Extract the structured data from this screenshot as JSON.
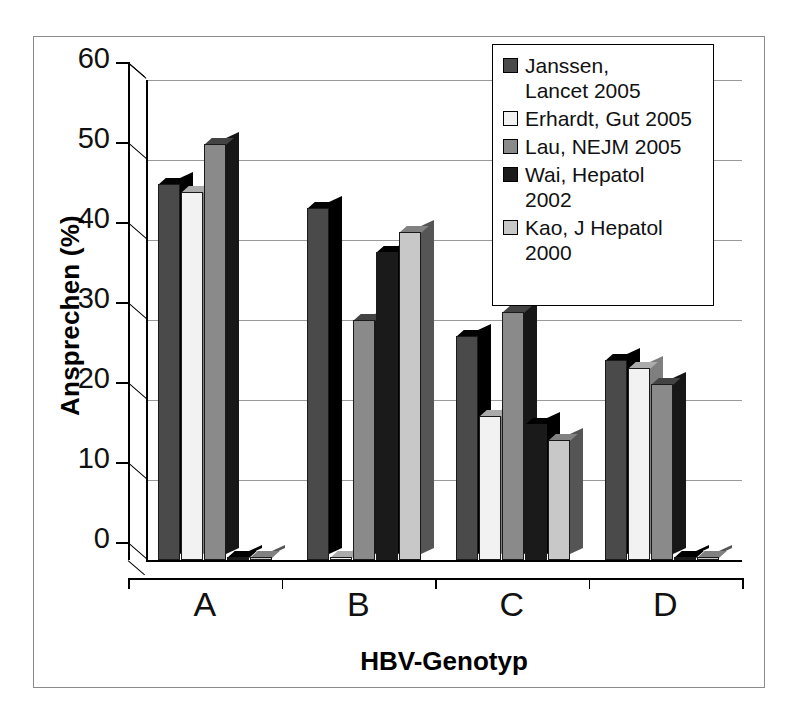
{
  "chart_data": {
    "type": "bar",
    "title": "",
    "xlabel": "HBV-Genotyp",
    "ylabel": "Ansprechen (%)",
    "categories": [
      "A",
      "B",
      "C",
      "D"
    ],
    "ylim": [
      0,
      60
    ],
    "yticks": [
      0,
      10,
      20,
      30,
      40,
      50,
      60
    ],
    "grid": true,
    "legend_position": "top-right",
    "style": "3d-clustered-column",
    "series": [
      {
        "name": "Janssen, Lancet 2005",
        "color": "#4a4a4a",
        "values": [
          47,
          44,
          28,
          25
        ]
      },
      {
        "name": "Erhardt, Gut 2005",
        "color": "#f2f2f2",
        "values": [
          46,
          0,
          18,
          24
        ]
      },
      {
        "name": "Lau, NEJM 2005",
        "color": "#8a8a8a",
        "values": [
          52,
          30,
          31,
          22
        ]
      },
      {
        "name": "Wai, Hepatol 2002",
        "color": "#1a1a1a",
        "values": [
          0,
          38.5,
          17,
          0
        ]
      },
      {
        "name": "Kao, J Hepatol 2000",
        "color": "#c8c8c8",
        "values": [
          0,
          41,
          15,
          0
        ]
      }
    ]
  },
  "axis": {
    "ytick_labels": [
      "60",
      "50",
      "40",
      "30",
      "20",
      "10",
      "0"
    ],
    "xtick_labels": [
      "A",
      "B",
      "C",
      "D"
    ],
    "y_title": "Ansprechen (%)",
    "x_title": "HBV-Genotyp"
  },
  "legend": {
    "items": [
      {
        "label": "Janssen,\nLancet 2005",
        "line1": "Janssen,",
        "line2": "Lancet 2005",
        "swatch": "#4a4a4a"
      },
      {
        "label": "Erhardt, Gut 2005",
        "line1": "Erhardt, Gut 2005",
        "line2": "",
        "swatch": "#f2f2f2"
      },
      {
        "label": "Lau, NEJM 2005",
        "line1": "Lau, NEJM 2005",
        "line2": "",
        "swatch": "#8a8a8a"
      },
      {
        "label": "Wai, Hepatol\n2002",
        "line1": "Wai, Hepatol",
        "line2": "2002",
        "swatch": "#1a1a1a"
      },
      {
        "label": "Kao, J Hepatol\n2000",
        "line1": "Kao, J Hepatol",
        "line2": "2000",
        "swatch": "#c8c8c8"
      }
    ]
  },
  "colors": {
    "background": "#ffffff",
    "frame": "#8a8a8a",
    "axis": "#000000",
    "gridline": "#9a9a9a",
    "bar_edge": "#1a1a1a"
  }
}
